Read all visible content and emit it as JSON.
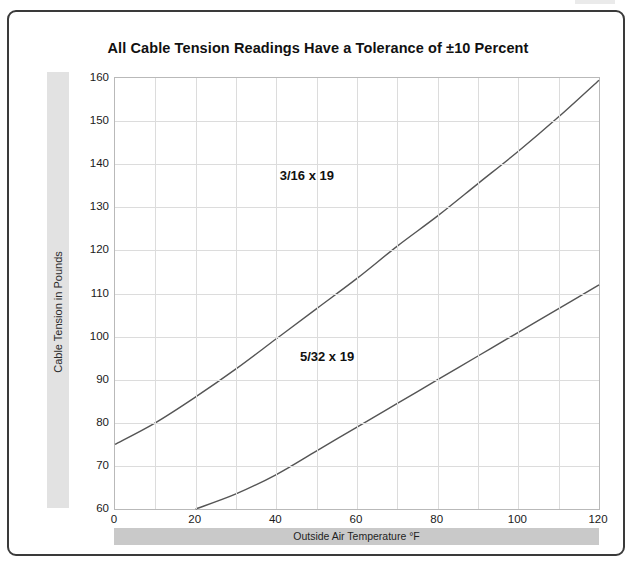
{
  "chart_data": {
    "type": "line",
    "title": "All Cable Tension Readings Have a Tolerance of ±10 Percent",
    "xlabel": "Outside Air Temperature °F",
    "ylabel": "Cable Tension in Pounds",
    "xlim": [
      0,
      120
    ],
    "ylim": [
      60,
      160
    ],
    "xticks": [
      0,
      20,
      40,
      60,
      80,
      100,
      120
    ],
    "yticks": [
      60,
      70,
      80,
      90,
      100,
      110,
      120,
      130,
      140,
      150,
      160
    ],
    "grid": true,
    "legend_position": "inline-annotation",
    "line_color": "#555555",
    "series": [
      {
        "name": "3/16 x 19",
        "label": "3/16 x 19",
        "x": [
          0,
          10,
          20,
          30,
          40,
          50,
          60,
          70,
          80,
          90,
          100,
          110,
          120
        ],
        "values": [
          75,
          80,
          86,
          92.5,
          99.5,
          106.5,
          113.5,
          121,
          128,
          135.5,
          143,
          151,
          159.5
        ]
      },
      {
        "name": "5/32 x 19",
        "label": "5/32 x 19",
        "x": [
          20,
          30,
          40,
          50,
          60,
          70,
          80,
          90,
          100,
          110,
          120
        ],
        "values": [
          60,
          63.5,
          68,
          73.5,
          79,
          84.5,
          90,
          95.5,
          101,
          106.5,
          112
        ]
      }
    ],
    "annotations": [
      {
        "text": "3/16 x 19",
        "x": 53,
        "y": 137
      },
      {
        "text": "5/32 x 19",
        "x": 58,
        "y": 95
      }
    ]
  },
  "figure": {
    "title": "All Cable Tension Readings Have a Tolerance of ±10 Percent",
    "x_axis_title": "Outside Air Temperature °F",
    "y_axis_title": "Cable Tension in Pounds",
    "y_tick_labels": [
      "160",
      "150",
      "140",
      "130",
      "120",
      "110",
      "100",
      "90",
      "80",
      "70",
      "60"
    ],
    "x_tick_labels": [
      "0",
      "20",
      "40",
      "60",
      "80",
      "100",
      "120"
    ],
    "series_labels": [
      "3/16 x 19",
      "5/32 x 19"
    ]
  }
}
